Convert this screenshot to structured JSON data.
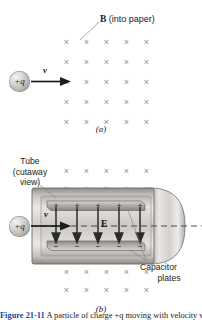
{
  "figure": {
    "caption_label": "Figure",
    "caption_number": "21-11",
    "caption_text": "A particle of charge +q moving with velocity v."
  },
  "panel_a": {
    "label": "(a)",
    "field_label_symbol": "B",
    "field_label_text": " (into paper)",
    "charge_label": "+q",
    "velocity_label": "v",
    "field_marks": {
      "symbol": "×",
      "rows": 5,
      "cols": 5,
      "meaning": "magnetic-field-into-page"
    }
  },
  "panel_b": {
    "label": "(b)",
    "tube_label_lines": [
      "Tube",
      "(cutaway",
      "view)"
    ],
    "capacitor_label_lines": [
      "Capacitor",
      "plates"
    ],
    "charge_label": "+q",
    "velocity_label": "v",
    "efield_label": "E",
    "top_plate_signs": [
      "+",
      "+",
      "+",
      "+",
      "+"
    ],
    "bottom_plate_signs": [
      "−",
      "−",
      "−",
      "−",
      "−"
    ],
    "field_marks": {
      "symbol": "×",
      "rows_above": 2,
      "rows_below": 2,
      "cols": 5,
      "meaning": "magnetic-field-into-page"
    }
  },
  "colors": {
    "xmark": "#8d8d8f",
    "tube_outline": "#6f6c6a",
    "plate": "#8e8b88",
    "text": "#231f20",
    "caption_accent": "#0b4ea2"
  }
}
